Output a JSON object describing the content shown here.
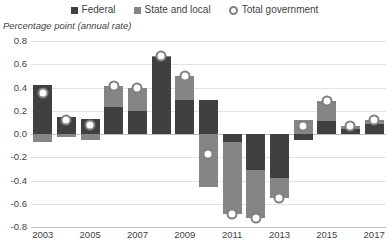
{
  "legend": {
    "items": [
      {
        "label": "Federal",
        "type": "swatch",
        "color": "#404040",
        "icon": "square-swatch"
      },
      {
        "label": "State and local",
        "type": "swatch",
        "color": "#858585",
        "icon": "square-swatch"
      },
      {
        "label": "Total government",
        "type": "marker",
        "color": "#808080",
        "icon": "circle-marker"
      }
    ]
  },
  "axis_title": "Percentage point (annual rate)",
  "colors": {
    "federal": "#404040",
    "state_local": "#858585",
    "marker_outline": "#808080",
    "gridline": "#e2e2e2",
    "zeroline": "#bdbdbd",
    "text": "#3f3f3f",
    "background": "#ffffff"
  },
  "chart_data": {
    "type": "bar",
    "stacked": true,
    "title": "",
    "subtitle": "",
    "xlabel": "",
    "ylabel": "Percentage point (annual rate)",
    "ylim": [
      -0.8,
      0.8
    ],
    "ytick_step": 0.2,
    "yticks": [
      "0.8",
      "0.6",
      "0.4",
      "0.2",
      "0.0",
      "-0.2",
      "-0.4",
      "-0.6",
      "-0.8"
    ],
    "ytick_values": [
      0.8,
      0.6,
      0.4,
      0.2,
      0.0,
      -0.2,
      -0.4,
      -0.6,
      -0.8
    ],
    "grid": true,
    "legend_position": "top",
    "categories": [
      2003,
      2004,
      2005,
      2006,
      2007,
      2008,
      2009,
      2010,
      2011,
      2012,
      2013,
      2014,
      2015,
      2016,
      2017
    ],
    "xtick_labels": [
      "2003",
      "2005",
      "2007",
      "2009",
      "2011",
      "2013",
      "2015",
      "2017"
    ],
    "xtick_values": [
      2003,
      2005,
      2007,
      2009,
      2011,
      2013,
      2015,
      2017
    ],
    "series": [
      {
        "name": "Federal",
        "color": "#404040",
        "values": [
          0.42,
          0.15,
          0.13,
          0.23,
          0.2,
          0.66,
          0.29,
          0.29,
          -0.07,
          -0.31,
          -0.38,
          -0.05,
          0.11,
          0.04,
          0.09
        ]
      },
      {
        "name": "State and local",
        "color": "#858585",
        "values": [
          -0.07,
          -0.03,
          -0.05,
          0.18,
          0.2,
          0.01,
          0.21,
          -0.46,
          -0.62,
          -0.41,
          -0.17,
          0.12,
          0.17,
          0.03,
          0.03
        ]
      },
      {
        "name": "Total government",
        "color": "#808080",
        "marker": "circle",
        "values": [
          0.35,
          0.12,
          0.08,
          0.41,
          0.4,
          0.67,
          0.5,
          -0.17,
          -0.69,
          -0.72,
          -0.55,
          0.07,
          0.28,
          0.07,
          0.12
        ]
      }
    ]
  }
}
